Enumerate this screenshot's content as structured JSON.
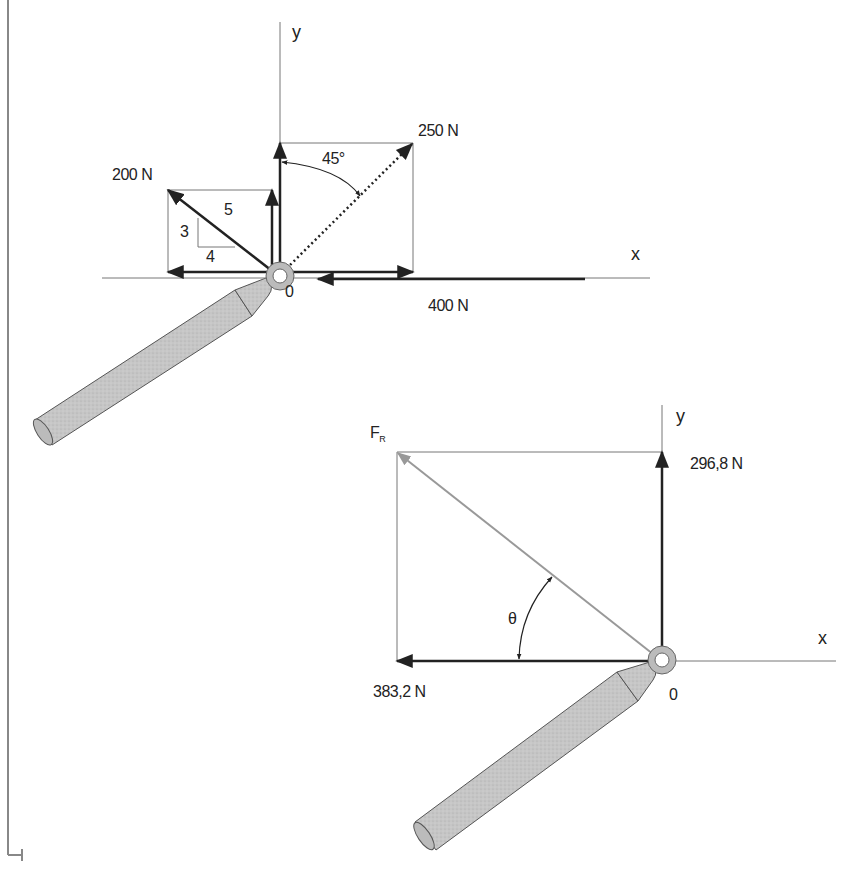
{
  "colors": {
    "ink": "#222222",
    "thin_line": "#777777",
    "resultant": "#999999",
    "handle_fill": "#c8c8c8",
    "handle_stroke": "#555555"
  },
  "top_diagram": {
    "axis_x_label": "x",
    "axis_y_label": "y",
    "origin_label": "0",
    "forces": [
      {
        "name": "200 N",
        "label": "200 N",
        "direction": "slope 3-4-5, up-left"
      },
      {
        "name": "250 N",
        "label": "250 N",
        "direction": "45° from y-axis, up-right"
      },
      {
        "name": "400 N",
        "label": "400 N",
        "direction": "-x"
      }
    ],
    "slope_triangle": {
      "rise": "3",
      "run": "4",
      "hyp": "5"
    },
    "angle_label": "45°"
  },
  "bottom_diagram": {
    "axis_x_label": "x",
    "axis_y_label": "y",
    "origin_label": "0",
    "resultant_label": "F",
    "resultant_sub": "R",
    "fy_label": "296,8 N",
    "fx_label": "383,2 N",
    "angle_label": "θ"
  }
}
